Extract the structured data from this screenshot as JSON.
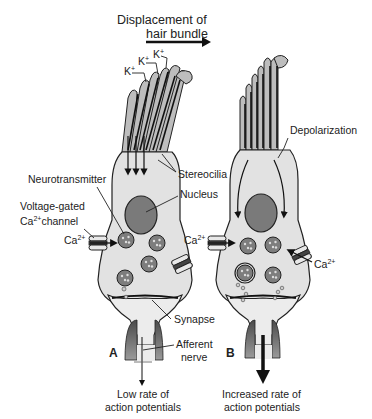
{
  "title": {
    "line1": "Displacement of",
    "line2": "hair bundle",
    "direction_arrow": "right"
  },
  "panel_a": {
    "label": "A",
    "ions": [
      {
        "symbol": "K",
        "charge": "+"
      },
      {
        "symbol": "K",
        "charge": "+"
      },
      {
        "symbol": "K",
        "charge": "+"
      }
    ],
    "labels": {
      "stereocilia": "Stereocilia",
      "neurotransmitter": "Neurotransmitter",
      "channel_line1": "Voltage-gated",
      "channel_line2_prefix": "Ca",
      "channel_line2_sup": "2+",
      "channel_line2_suffix": "channel",
      "ca_ion": "Ca",
      "ca_charge": "2+",
      "nucleus": "Nucleus",
      "synapse": "Synapse",
      "afferent_line1": "Afferent",
      "afferent_line2": "nerve",
      "output_line1": "Low rate of",
      "output_line2": "action potentials"
    }
  },
  "panel_b": {
    "label": "B",
    "labels": {
      "depolarization": "Depolarization",
      "ca_ion_left": "Ca",
      "ca_charge_left": "2+",
      "ca_ion_right": "Ca",
      "ca_charge_right": "2+",
      "output_line1": "Increased rate of",
      "output_line2": "action potentials"
    }
  },
  "colors": {
    "cell_fill": "#e2e2e2",
    "stereocilia_fill": "#bdbdbd",
    "nucleus_fill": "#7a7a7a",
    "vesicle_fill": "#7d7d7d",
    "nerve_dark": "#555555",
    "outline": "#222222"
  }
}
